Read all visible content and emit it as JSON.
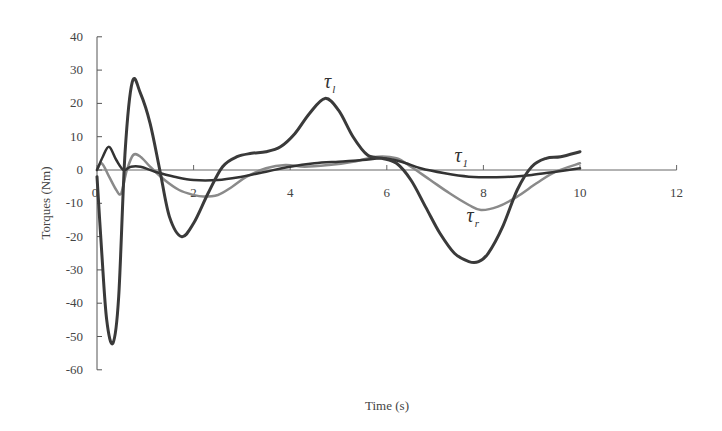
{
  "chart_data": {
    "type": "line",
    "title": "",
    "xlabel": "Time (s)",
    "ylabel": "Torques (Nm)",
    "xlim": [
      0,
      12
    ],
    "ylim": [
      -60,
      40
    ],
    "xticks": [
      0,
      2,
      4,
      6,
      8,
      10,
      12
    ],
    "yticks": [
      40,
      30,
      20,
      10,
      0,
      -10,
      -20,
      -30,
      -40,
      -50,
      -60
    ],
    "grid": false,
    "legend": "none (inline curve labels)",
    "series": [
      {
        "name": "τ_l",
        "color": "#3a3a3a",
        "width": 3,
        "x": [
          0,
          0.1,
          0.2,
          0.33,
          0.45,
          0.58,
          0.73,
          0.9,
          1.1,
          1.3,
          1.5,
          1.75,
          2.0,
          2.3,
          2.6,
          2.9,
          3.2,
          3.5,
          3.8,
          4.1,
          4.4,
          4.72,
          5.0,
          5.3,
          5.6,
          5.9,
          6.2,
          6.5,
          6.8,
          7.1,
          7.4,
          7.7,
          7.9,
          8.1,
          8.4,
          8.7,
          9.0,
          9.3,
          9.6,
          10.0
        ],
        "y": [
          -2,
          -25,
          -45,
          -52,
          -38,
          5,
          26.5,
          23,
          14,
          0,
          -14,
          -20,
          -16,
          -7,
          1,
          4,
          5,
          5.5,
          7,
          11,
          17,
          21.5,
          18,
          10,
          4.5,
          3.5,
          2,
          -3,
          -11,
          -19,
          -25,
          -27.5,
          -27.5,
          -25,
          -17,
          -6,
          1,
          3.5,
          4,
          5.5
        ]
      },
      {
        "name": "τ_1",
        "color": "#333333",
        "width": 2.5,
        "x": [
          0,
          0.12,
          0.25,
          0.4,
          0.55,
          0.7,
          0.9,
          1.2,
          1.6,
          2.0,
          2.5,
          3.0,
          3.5,
          4.0,
          4.5,
          5.0,
          5.5,
          5.9,
          6.3,
          6.7,
          7.2,
          7.7,
          8.2,
          8.6,
          9.0,
          9.5,
          10.0
        ],
        "y": [
          0,
          4,
          7,
          3,
          0,
          1,
          1,
          -0.5,
          -2,
          -3,
          -3,
          -2,
          -0.5,
          1,
          2,
          2.5,
          3,
          3.5,
          2.5,
          0.5,
          -1,
          -2,
          -2.2,
          -2,
          -1.5,
          -0.5,
          0.5
        ]
      },
      {
        "name": "τ_r",
        "color": "#8a8a8a",
        "width": 2.5,
        "x": [
          0,
          0.1,
          0.25,
          0.4,
          0.5,
          0.62,
          0.75,
          0.9,
          1.1,
          1.4,
          1.7,
          2.0,
          2.2,
          2.5,
          2.8,
          3.1,
          3.5,
          3.9,
          4.3,
          4.8,
          5.3,
          5.8,
          6.2,
          6.5,
          6.9,
          7.3,
          7.7,
          7.95,
          8.3,
          8.7,
          9.1,
          9.5,
          10.0
        ],
        "y": [
          0,
          2,
          -2,
          -6,
          -7,
          0,
          4.5,
          4,
          1,
          -3,
          -6,
          -7.5,
          -8,
          -7.5,
          -5,
          -2,
          0.5,
          1.5,
          1,
          1.5,
          2.5,
          4,
          3.5,
          1,
          -3,
          -7,
          -10.5,
          -12,
          -11,
          -8,
          -4,
          -0.5,
          2
        ]
      }
    ],
    "annotations": [
      {
        "text": "τ",
        "sub": "l",
        "x": 4.7,
        "y": 24.5
      },
      {
        "text": "τ",
        "sub": "1",
        "x": 7.4,
        "y": 2.5
      },
      {
        "text": "τ",
        "sub": "r",
        "x": 7.65,
        "y": -15.5
      }
    ]
  },
  "labels": {
    "xlabel": "Time (s)",
    "ylabel": "Torques (Nm)"
  }
}
